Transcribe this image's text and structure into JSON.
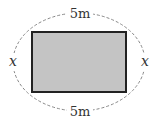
{
  "diagram": {
    "shape": "rectangle",
    "top_label": "5m",
    "bottom_label": "5m",
    "left_label": "x",
    "right_label": "x",
    "fill_color": "#c4c4c4",
    "stroke_color": "#222222",
    "dashed_color": "#888888"
  }
}
